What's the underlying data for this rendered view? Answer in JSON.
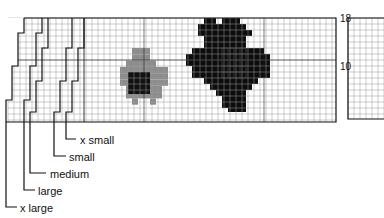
{
  "main_chart": {
    "title": "Lower right front chart",
    "row_labels": [
      {
        "text": "18",
        "row": 18
      },
      {
        "text": "10",
        "row": 10
      }
    ],
    "size_legend": [
      {
        "label": "x small"
      },
      {
        "label": "small"
      },
      {
        "label": "medium"
      },
      {
        "label": "large"
      },
      {
        "label": "x large"
      }
    ],
    "motifs": [
      {
        "name": "grey-flower",
        "color_outer": "#8c8c8c",
        "color_center": "#111111"
      },
      {
        "name": "black-flower",
        "color_outer": "#0d0d0d",
        "color_center_grid": "#3a3a3a"
      }
    ]
  },
  "partial_chart": {
    "title": "Low"
  },
  "colors": {
    "grid_line": "#9a9a9a",
    "major_line": "#222222",
    "grey_motif": "#8c8c8c",
    "black_motif": "#0d0d0d"
  }
}
